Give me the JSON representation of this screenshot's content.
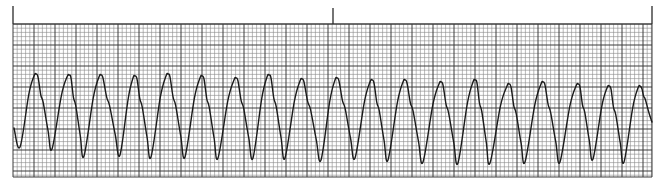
{
  "title": "",
  "colors": {
    "background": "#ffffff",
    "minor_grid": "#8a8a8a",
    "major_grid": "#3c3c3c",
    "trace": "#1a1a1a",
    "marker": "#2a2a2a"
  },
  "grid": {
    "left": 13,
    "top": 24,
    "right": 652,
    "bottom": 177,
    "minor_spacing": 4.2,
    "major_every": 5
  },
  "markers": [
    {
      "x": 13,
      "y_top": 6,
      "y_bottom": 24
    },
    {
      "x": 333,
      "y_top": 8,
      "y_bottom": 24
    },
    {
      "x": 652,
      "y_top": 6,
      "y_bottom": 24
    }
  ],
  "chart_data": {
    "type": "line",
    "title": "",
    "xlabel": "",
    "ylabel": "",
    "grid": true,
    "legend": null,
    "peaks": [
      {
        "x": 36,
        "y": 74
      },
      {
        "x": 69,
        "y": 75
      },
      {
        "x": 101,
        "y": 75
      },
      {
        "x": 135,
        "y": 76
      },
      {
        "x": 168,
        "y": 74
      },
      {
        "x": 202,
        "y": 76
      },
      {
        "x": 236,
        "y": 78
      },
      {
        "x": 269,
        "y": 75
      },
      {
        "x": 302,
        "y": 79
      },
      {
        "x": 337,
        "y": 78
      },
      {
        "x": 372,
        "y": 80
      },
      {
        "x": 405,
        "y": 80
      },
      {
        "x": 441,
        "y": 82
      },
      {
        "x": 475,
        "y": 80
      },
      {
        "x": 509,
        "y": 84
      },
      {
        "x": 543,
        "y": 82
      },
      {
        "x": 578,
        "y": 84
      },
      {
        "x": 609,
        "y": 86
      },
      {
        "x": 640,
        "y": 86
      }
    ],
    "troughs": [
      {
        "x": 20,
        "y": 147
      },
      {
        "x": 52,
        "y": 149
      },
      {
        "x": 84,
        "y": 156
      },
      {
        "x": 120,
        "y": 155
      },
      {
        "x": 151,
        "y": 157
      },
      {
        "x": 185,
        "y": 157
      },
      {
        "x": 218,
        "y": 158
      },
      {
        "x": 253,
        "y": 158
      },
      {
        "x": 285,
        "y": 158
      },
      {
        "x": 321,
        "y": 160
      },
      {
        "x": 355,
        "y": 158
      },
      {
        "x": 388,
        "y": 160
      },
      {
        "x": 423,
        "y": 162
      },
      {
        "x": 458,
        "y": 163
      },
      {
        "x": 490,
        "y": 163
      },
      {
        "x": 525,
        "y": 162
      },
      {
        "x": 560,
        "y": 162
      },
      {
        "x": 593,
        "y": 159
      },
      {
        "x": 624,
        "y": 162
      }
    ],
    "start": {
      "x": 14,
      "y": 128
    },
    "end": {
      "x": 652,
      "y": 122
    }
  }
}
